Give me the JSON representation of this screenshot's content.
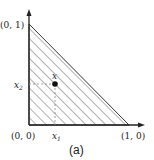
{
  "figure": {
    "caption": "(a)",
    "vertices": {
      "origin": "(0, 0)",
      "x_vertex": "(1, 0)",
      "y_vertex": "(0, 1)"
    },
    "point": {
      "label": "x",
      "x_coord_label": "x",
      "x_coord_sub": "1",
      "y_coord_label": "x",
      "y_coord_sub": "2"
    },
    "colors": {
      "stroke": "#222222",
      "hatch": "#555555",
      "dash": "#888888",
      "background": "#ffffff"
    }
  }
}
